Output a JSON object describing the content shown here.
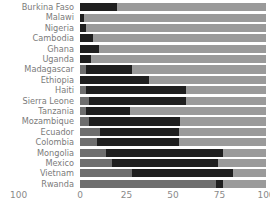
{
  "chart_data": {
    "type": "bar",
    "title": "",
    "subtitle": "",
    "xlabel": "",
    "ylabel": "",
    "orientation": "horizontal",
    "stacked": true,
    "grid": false,
    "legend": "none",
    "xlim": [
      0,
      100
    ],
    "xticks": [
      0,
      25,
      50,
      75,
      100
    ],
    "xtick_labels": [
      "0",
      "25",
      "50",
      "75",
      "100"
    ],
    "left_axis_label": "100",
    "categories": [
      "Burkina Faso",
      "Malawi",
      "Nigeria",
      "Cambodia",
      "Ghana",
      "Uganda",
      "Madagascar",
      "Ethiopia",
      "Haiti",
      "Sierra Leone",
      "Tanzania",
      "Mozambique",
      "Ecuador",
      "Colombia",
      "Mongolia",
      "Mexico",
      "Vietnam",
      "Rwanda"
    ],
    "series": [
      {
        "name": "lower",
        "color": "#6e6e6e",
        "values": [
          0,
          0,
          0,
          0,
          0,
          0,
          3,
          0,
          3,
          5,
          3,
          5,
          11,
          9,
          14,
          17,
          28,
          73
        ]
      },
      {
        "name": "middle",
        "color": "#1f1f1f",
        "values": [
          20,
          2,
          3,
          7,
          10,
          6,
          25,
          37,
          54,
          52,
          24,
          49,
          42,
          44,
          63,
          57,
          54,
          4
        ]
      },
      {
        "name": "upper",
        "color": "#9a9a9a",
        "values": [
          80,
          98,
          97,
          93,
          90,
          94,
          72,
          63,
          43,
          43,
          73,
          46,
          47,
          47,
          23,
          26,
          18,
          23
        ]
      }
    ],
    "segment_bounds": [
      [
        0,
        20,
        100
      ],
      [
        0,
        2,
        100
      ],
      [
        0,
        3,
        100
      ],
      [
        0,
        7,
        100
      ],
      [
        0,
        10,
        100
      ],
      [
        0,
        6,
        100
      ],
      [
        3,
        28,
        100
      ],
      [
        0,
        37,
        100
      ],
      [
        3,
        57,
        100
      ],
      [
        5,
        57,
        100
      ],
      [
        3,
        27,
        100
      ],
      [
        5,
        54,
        100
      ],
      [
        11,
        53,
        100
      ],
      [
        9,
        53,
        100
      ],
      [
        14,
        77,
        100
      ],
      [
        17,
        74,
        100
      ],
      [
        28,
        82,
        100
      ],
      [
        73,
        77,
        100
      ]
    ],
    "colors": {
      "segment_low": "#6e6e6e",
      "segment_mid": "#1f1f1f",
      "segment_high": "#9a9a9a",
      "text": "#7b7b7b",
      "axis_text": "#8a8a8a",
      "background": "#ffffff"
    }
  }
}
